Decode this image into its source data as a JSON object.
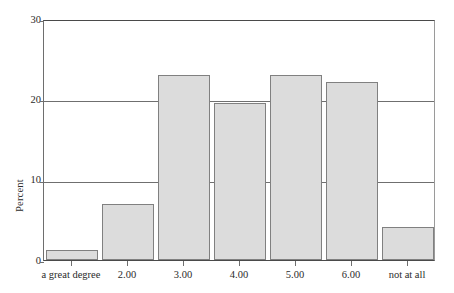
{
  "chart_data": {
    "type": "bar",
    "title": "",
    "subtitle": "",
    "xlabel": "",
    "ylabel": "Percent",
    "categories": [
      "a great degree",
      "2.00",
      "3.00",
      "4.00",
      "5.00",
      "6.00",
      "not at all"
    ],
    "values": [
      1.3,
      7.0,
      23.0,
      19.5,
      23.0,
      22.2,
      4.1
    ],
    "ylim": [
      0,
      30
    ],
    "y_ticks": [
      0,
      10,
      20,
      30
    ],
    "y_tick_labels": [
      "0",
      "10",
      "20",
      "30"
    ],
    "grid": "horizontal",
    "legend": "none",
    "bar_fill_color": "#dcdcdc",
    "bar_border_color": "#808080",
    "axis_color": "#4a4a4a",
    "gridline_color": "#6f6f6f",
    "background_color": "#ffffff",
    "annotations": []
  },
  "axes": {
    "y_title": "Percent",
    "y_tick_labels": [
      "30",
      "20",
      "10",
      "0"
    ],
    "x_tick_labels": [
      "a great degree",
      "2.00",
      "3.00",
      "4.00",
      "5.00",
      "6.00",
      "not at all"
    ]
  }
}
